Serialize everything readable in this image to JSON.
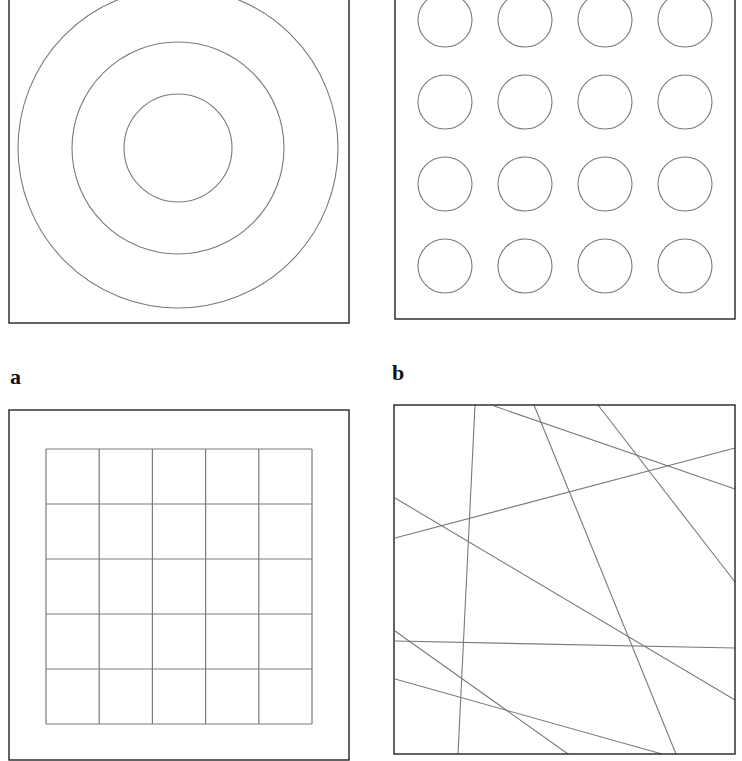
{
  "figure": {
    "labels": {
      "a": "a",
      "b": "b"
    },
    "colors": {
      "frame": "#222222",
      "stroke": "#7a7a7a",
      "background": "#ffffff"
    },
    "panels": [
      {
        "id": "concentric-circles",
        "frame": [
          9,
          -2,
          349,
          323
        ],
        "circles": [
          {
            "cx": 178,
            "cy": 148,
            "r": 160
          },
          {
            "cx": 178,
            "cy": 148,
            "r": 106
          },
          {
            "cx": 178,
            "cy": 148,
            "r": 54
          }
        ]
      },
      {
        "id": "circle-grid",
        "frame": [
          395,
          -2,
          735,
          319
        ],
        "grid": {
          "cols": [
            445,
            525,
            605,
            685
          ],
          "rows": [
            20,
            102,
            184,
            266
          ],
          "r": 27
        }
      },
      {
        "id": "square-grid",
        "frame": [
          9,
          410,
          349,
          760
        ],
        "grid": {
          "x0": 46,
          "x1": 312,
          "y0": 449,
          "y1": 724,
          "divisions": 5
        }
      },
      {
        "id": "random-lines",
        "frame": [
          394,
          405,
          735,
          754
        ],
        "lines": [
          [
            475,
            405,
            458,
            754
          ],
          [
            494,
            406,
            735,
            489
          ],
          [
            534,
            405,
            676,
            754
          ],
          [
            598,
            405,
            735,
            582
          ],
          [
            395,
            538,
            735,
            448
          ],
          [
            395,
            498,
            735,
            700
          ],
          [
            395,
            641,
            735,
            648
          ],
          [
            395,
            631,
            568,
            754
          ],
          [
            395,
            679,
            662,
            754
          ]
        ]
      }
    ]
  }
}
